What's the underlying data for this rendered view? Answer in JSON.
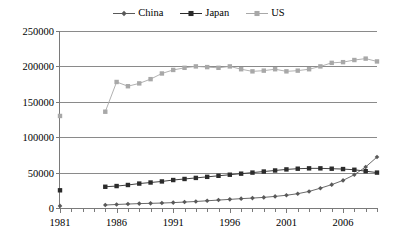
{
  "legend": {
    "position": "top-center",
    "entries": [
      {
        "label": "China",
        "color": "#595959",
        "marker": "diamond"
      },
      {
        "label": "Japan",
        "color": "#2b2b2b",
        "marker": "square"
      },
      {
        "label": "US",
        "color": "#a8a8a8",
        "marker": "square"
      }
    ]
  },
  "axes": {
    "y_ticks": [
      "0",
      "50000",
      "100000",
      "150000",
      "200000",
      "250000"
    ],
    "x_labels": [
      "1981",
      "1986",
      "1991",
      "1996",
      "2001",
      "2006"
    ]
  },
  "chart_data": {
    "type": "line",
    "title": "",
    "subtitle": "",
    "xlabel": "",
    "ylabel": "",
    "xlim": [
      1981,
      2009
    ],
    "ylim": [
      0,
      250000
    ],
    "grid": true,
    "legend_position": "top-center",
    "x": [
      1981,
      1982,
      1983,
      1984,
      1985,
      1986,
      1987,
      1988,
      1989,
      1990,
      1991,
      1992,
      1993,
      1994,
      1995,
      1996,
      1997,
      1998,
      1999,
      2000,
      2001,
      2002,
      2003,
      2004,
      2005,
      2006,
      2007,
      2008,
      2009
    ],
    "x_tick_labels": [
      "1981",
      "1986",
      "1991",
      "1996",
      "2001",
      "2006"
    ],
    "y_tick_labels": [
      "0",
      "50000",
      "100000",
      "150000",
      "200000",
      "250000"
    ],
    "series": [
      {
        "name": "China",
        "color": "#595959",
        "marker": "diamond",
        "values": [
          3000,
          null,
          null,
          null,
          4200,
          5000,
          5600,
          6200,
          6600,
          7000,
          7600,
          8400,
          9200,
          10200,
          11200,
          12200,
          13200,
          14000,
          15000,
          16400,
          18000,
          20200,
          23400,
          28000,
          33000,
          39000,
          47000,
          58000,
          72000
        ]
      },
      {
        "name": "Japan",
        "color": "#2b2b2b",
        "marker": "square",
        "values": [
          25000,
          null,
          null,
          null,
          30000,
          31000,
          32500,
          34500,
          36000,
          37500,
          39500,
          41000,
          42500,
          44000,
          45500,
          47000,
          48500,
          50000,
          51500,
          53000,
          54500,
          55500,
          56000,
          56000,
          55500,
          55000,
          54000,
          52000,
          50000
        ]
      },
      {
        "name": "US",
        "color": "#a8a8a8",
        "marker": "square",
        "values": [
          130000,
          null,
          null,
          null,
          136000,
          178000,
          172000,
          176000,
          182000,
          190000,
          195000,
          198000,
          200000,
          199000,
          198000,
          200000,
          196000,
          193000,
          194000,
          196000,
          193000,
          194000,
          196000,
          200000,
          205000,
          206000,
          209000,
          211000,
          207000
        ]
      }
    ]
  }
}
